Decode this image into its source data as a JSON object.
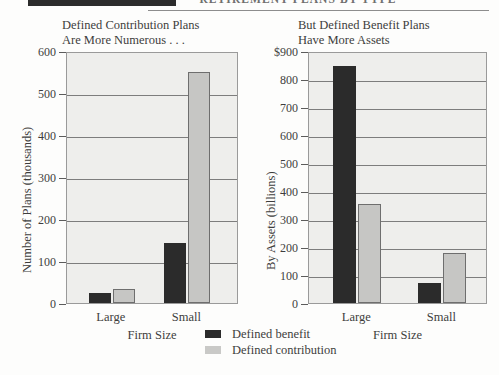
{
  "header": {
    "title": "RETIREMENT PLANS BY TYPE"
  },
  "legend": {
    "entries": [
      {
        "label": "Defined benefit",
        "color": "#2b2b2b",
        "swatch": "dark"
      },
      {
        "label": "Defined contribution",
        "color": "#c9c9c7",
        "swatch": "light"
      }
    ]
  },
  "colors": {
    "defined_benefit": "#2b2b2b",
    "defined_contribution": "#c6c6c4",
    "plot_background": "#eeeeec",
    "gridline": "#7d7d7d",
    "page_background": "#fdfdfc",
    "text": "#3d3d3d"
  },
  "chart_data": [
    {
      "type": "bar",
      "title": "Defined Contribution Plans Are More Numerous . . .",
      "title_line1": "Defined Contribution Plans",
      "title_line2": "Are More Numerous . . .",
      "xlabel": "Firm Size",
      "ylabel": "Number of Plans (thousands)",
      "categories": [
        "Large",
        "Small"
      ],
      "ylim": [
        0,
        600
      ],
      "yticks": [
        0,
        100,
        200,
        300,
        400,
        500,
        600
      ],
      "ytick_labels": [
        "0",
        "100",
        "200",
        "300",
        "400",
        "500",
        "600"
      ],
      "grid": true,
      "legend_position": "below-figure",
      "series": [
        {
          "name": "Defined benefit",
          "values": [
            25,
            142
          ]
        },
        {
          "name": "Defined contribution",
          "values": [
            33,
            550
          ]
        }
      ]
    },
    {
      "type": "bar",
      "title": "But Defined Benefit Plans Have More Assets",
      "title_line1": "But Defined Benefit Plans",
      "title_line2": "Have More Assets",
      "xlabel": "Firm Size",
      "ylabel": "By Assets (billions)",
      "categories": [
        "Large",
        "Small"
      ],
      "ylim": [
        0,
        900
      ],
      "yticks": [
        0,
        100,
        200,
        300,
        400,
        500,
        600,
        700,
        800,
        900
      ],
      "ytick_labels": [
        "0",
        "100",
        "200",
        "300",
        "400",
        "500",
        "600",
        "700",
        "800",
        "$900"
      ],
      "grid": true,
      "legend_position": "below-figure",
      "series": [
        {
          "name": "Defined benefit",
          "values": [
            845,
            72
          ]
        },
        {
          "name": "Defined contribution",
          "values": [
            355,
            178
          ]
        }
      ]
    }
  ]
}
